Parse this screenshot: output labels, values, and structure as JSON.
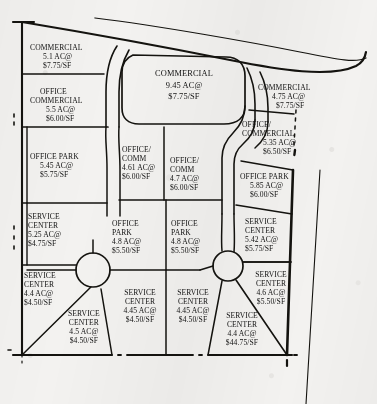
{
  "document": {
    "kind": "land-use-plat-map",
    "units": {
      "area": "AC@",
      "price": "/SF"
    },
    "background_color": "#f3f2f0",
    "ink_color": "#121212"
  },
  "parcels": [
    {
      "id": "p1",
      "use": "COMMERCIAL",
      "use2": "",
      "acres": "5.1 AC@",
      "price": "$7.75/SF"
    },
    {
      "id": "p2",
      "use": "OFFICE",
      "use2": "COMMERCIAL",
      "acres": "5.5 AC@",
      "price": "$6.00/SF"
    },
    {
      "id": "p3",
      "use": "OFFICE PARK",
      "use2": "",
      "acres": "5.45 AC@",
      "price": "$5.75/SF"
    },
    {
      "id": "p4",
      "use": "SERVICE",
      "use2": "CENTER",
      "acres": "5.25 AC@",
      "price": "$4.75/SF"
    },
    {
      "id": "p5",
      "use": "SERVICE",
      "use2": "CENTER",
      "acres": "4.4 AC@",
      "price": "$4.50/SF"
    },
    {
      "id": "p6",
      "use": "SERVICE",
      "use2": "CENTER",
      "acres": "4.5 AC@",
      "price": "$4.50/SF"
    },
    {
      "id": "p7",
      "use": "COMMERCIAL",
      "use2": "",
      "acres": "9.45 AC@",
      "price": "$7.75/SF"
    },
    {
      "id": "p8",
      "use": "OFFICE/",
      "use2": "COMM",
      "acres": "4.61 AC@",
      "price": "$6.00/SF"
    },
    {
      "id": "p9",
      "use": "OFFICE/",
      "use2": "COMM",
      "acres": "4.7 AC@",
      "price": "$6.00/SF"
    },
    {
      "id": "p10",
      "use": "OFFICE",
      "use2": "PARK",
      "acres": "4.8 AC@",
      "price": "$5.50/SF"
    },
    {
      "id": "p11",
      "use": "OFFICE",
      "use2": "PARK",
      "acres": "4.8 AC@",
      "price": "$5.50/SF"
    },
    {
      "id": "p12",
      "use": "SERVICE",
      "use2": "CENTER",
      "acres": "4.45 AC@",
      "price": "$4.50/SF"
    },
    {
      "id": "p13",
      "use": "SERVICE",
      "use2": "CENTER",
      "acres": "4.45 AC@",
      "price": "$4.50/SF"
    },
    {
      "id": "p14",
      "use": "COMMERCIAL",
      "use2": "",
      "acres": "4.75 AC@",
      "price": "$7.75/SF"
    },
    {
      "id": "p15",
      "use": "OFFICE/",
      "use2": "COMMERCIAL",
      "acres": "5.35 AC@",
      "price": "$6.50/SF"
    },
    {
      "id": "p16",
      "use": "OFFICE PARK",
      "use2": "",
      "acres": "5.85 AC@",
      "price": "$6.00/SF"
    },
    {
      "id": "p17",
      "use": "SERVICE",
      "use2": "CENTER",
      "acres": "5.42 AC@",
      "price": "$5.75/SF"
    },
    {
      "id": "p18",
      "use": "SERVICE",
      "use2": "CENTER",
      "acres": "4.6 AC@",
      "price": "$5.50/SF"
    },
    {
      "id": "p19",
      "use": "SERVICE",
      "use2": "CENTER",
      "acres": "4.4 AC@",
      "price": "$44.75/SF"
    }
  ]
}
